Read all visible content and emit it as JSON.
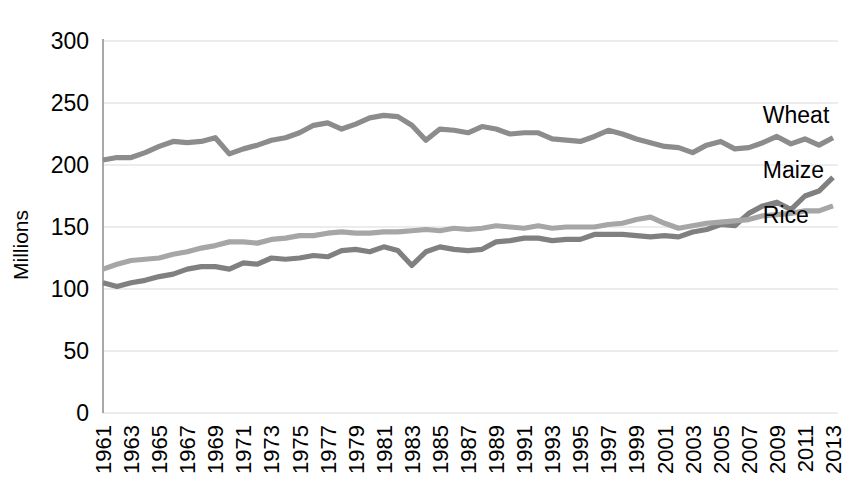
{
  "chart_data": {
    "type": "line",
    "title": "",
    "subtitle": "",
    "xlabel": "",
    "ylabel": "Millions",
    "ylim": [
      0,
      300
    ],
    "ytick_values": [
      0,
      50,
      100,
      150,
      200,
      250,
      300
    ],
    "ytick_labels": [
      "0",
      "50",
      "100",
      "150",
      "200",
      "250",
      "300"
    ],
    "grid": true,
    "legend_position": "right-inline",
    "xlim": [
      1961,
      2013
    ],
    "x": [
      1961,
      1962,
      1963,
      1964,
      1965,
      1966,
      1967,
      1968,
      1969,
      1970,
      1971,
      1972,
      1973,
      1974,
      1975,
      1976,
      1977,
      1978,
      1979,
      1980,
      1981,
      1982,
      1983,
      1984,
      1985,
      1986,
      1987,
      1988,
      1989,
      1990,
      1991,
      1992,
      1993,
      1994,
      1995,
      1996,
      1997,
      1998,
      1999,
      2000,
      2001,
      2002,
      2003,
      2004,
      2005,
      2006,
      2007,
      2008,
      2009,
      2010,
      2011,
      2012,
      2013
    ],
    "xtick_labels": [
      "1961",
      "1963",
      "1965",
      "1967",
      "1969",
      "1971",
      "1973",
      "1975",
      "1977",
      "1979",
      "1981",
      "1983",
      "1985",
      "1987",
      "1989",
      "1991",
      "1993",
      "1995",
      "1997",
      "1999",
      "2001",
      "2003",
      "2005",
      "2007",
      "2009",
      "2011",
      "2013"
    ],
    "xtick_step": 2,
    "series": [
      {
        "name": "Wheat",
        "color": "#8c8c8c",
        "label_x": 2008,
        "label_y": 240,
        "values": [
          204,
          206,
          206,
          210,
          215,
          219,
          218,
          219,
          222,
          209,
          213,
          216,
          220,
          222,
          226,
          232,
          234,
          229,
          233,
          238,
          240,
          239,
          232,
          220,
          229,
          228,
          226,
          231,
          229,
          225,
          226,
          226,
          221,
          220,
          219,
          223,
          228,
          225,
          221,
          218,
          215,
          214,
          210,
          216,
          219,
          213,
          214,
          218,
          223,
          217,
          221,
          216,
          222
        ]
      },
      {
        "name": "Maize",
        "color": "#808080",
        "label_x": 2008,
        "label_y": 196,
        "values": [
          105,
          102,
          105,
          107,
          110,
          112,
          116,
          118,
          118,
          116,
          121,
          120,
          125,
          124,
          125,
          127,
          126,
          131,
          132,
          130,
          134,
          131,
          119,
          130,
          134,
          132,
          131,
          132,
          138,
          139,
          141,
          141,
          139,
          140,
          140,
          144,
          144,
          144,
          143,
          142,
          143,
          142,
          146,
          148,
          152,
          151,
          161,
          167,
          170,
          164,
          175,
          179,
          190
        ]
      },
      {
        "name": "Rice",
        "color": "#a6a6a6",
        "label_x": 2008,
        "label_y": 160,
        "values": [
          116,
          120,
          123,
          124,
          125,
          128,
          130,
          133,
          135,
          138,
          138,
          137,
          140,
          141,
          143,
          143,
          145,
          146,
          145,
          145,
          146,
          146,
          147,
          148,
          147,
          149,
          148,
          149,
          151,
          150,
          149,
          151,
          149,
          150,
          150,
          150,
          152,
          153,
          156,
          158,
          153,
          149,
          151,
          153,
          154,
          155,
          156,
          159,
          160,
          161,
          163,
          163,
          167
        ]
      }
    ]
  }
}
